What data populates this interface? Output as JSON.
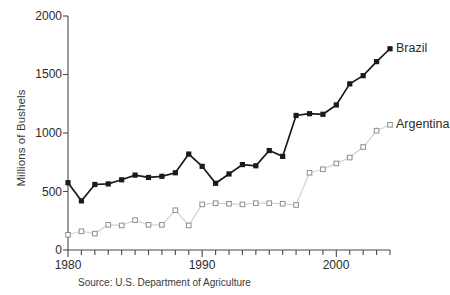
{
  "chart_data": {
    "type": "line",
    "title": "",
    "subtitle": "",
    "xlabel": "",
    "ylabel": "Millions of Bushels",
    "xlim": [
      1980,
      2004
    ],
    "ylim": [
      0,
      2000
    ],
    "grid": false,
    "legend_position": "inline-right-end-of-series",
    "x_tick_labels": [
      "1980",
      "1990",
      "2000"
    ],
    "x_tick_values": [
      1980,
      1990,
      2000
    ],
    "x_minor_ticks_every": 1,
    "y_tick_labels": [
      "0",
      "500",
      "1000",
      "1500",
      "2000"
    ],
    "y_tick_values": [
      0,
      500,
      1000,
      1500,
      2000
    ],
    "x": [
      1980,
      1981,
      1982,
      1983,
      1984,
      1985,
      1986,
      1987,
      1988,
      1989,
      1990,
      1991,
      1992,
      1993,
      1994,
      1995,
      1996,
      1997,
      1998,
      1999,
      2000,
      2001,
      2002,
      2003,
      2004
    ],
    "series": [
      {
        "name": "Brazil",
        "marker": "filled-square",
        "color": "#1a1a1a",
        "line_color": "#1a1a1a",
        "values": [
          575,
          420,
          560,
          565,
          600,
          640,
          620,
          630,
          660,
          820,
          715,
          570,
          650,
          730,
          720,
          850,
          800,
          1150,
          1165,
          1160,
          1240,
          1420,
          1490,
          1610,
          1720
        ]
      },
      {
        "name": "Argentina",
        "marker": "open-square",
        "color": "#8e8e8e",
        "line_color": "#d2d2d2",
        "values": [
          130,
          160,
          140,
          215,
          210,
          255,
          215,
          215,
          340,
          210,
          390,
          400,
          395,
          390,
          400,
          400,
          395,
          385,
          660,
          690,
          740,
          790,
          880,
          1020,
          1070
        ]
      }
    ],
    "source": "Source: U.S. Department of Agriculture"
  },
  "labels": {
    "brazil": "Brazil",
    "argentina": "Argentina",
    "ylabel": "Millions of Bushels",
    "source": "Source: U.S. Department of Agriculture",
    "y0": "0",
    "y500": "500",
    "y1000": "1000",
    "y1500": "1500",
    "y2000": "2000",
    "x1980": "1980",
    "x1990": "1990",
    "x2000": "2000"
  }
}
